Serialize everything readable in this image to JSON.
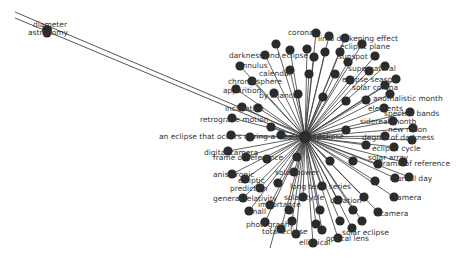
{
  "graph": {
    "type": "network",
    "layout": "radial-star",
    "colors": {
      "node": "#2b2b2b",
      "edge": "#3a3a3a",
      "label": "#333333",
      "background": "#ffffff"
    },
    "hub": {
      "x": 305,
      "y": 137,
      "label": "solar eclipse"
    },
    "outlier": {
      "x": 47,
      "y": 30,
      "labels": [
        "diameter",
        "astronomy"
      ]
    },
    "long_edges": [
      {
        "x1": 15,
        "y1": 12,
        "x2": 305,
        "y2": 135
      },
      {
        "x1": 15,
        "y1": 18,
        "x2": 305,
        "y2": 139
      }
    ],
    "nodes": [
      {
        "x": 316,
        "y": 33,
        "label": "corona"
      },
      {
        "x": 329,
        "y": 36,
        "label": "shadow"
      },
      {
        "x": 345,
        "y": 38,
        "label": "limb darkening effect"
      },
      {
        "x": 362,
        "y": 44,
        "label": "ecliptic plane"
      },
      {
        "x": 276,
        "y": 44,
        "label": "sun"
      },
      {
        "x": 290,
        "y": 50,
        "label": ""
      },
      {
        "x": 307,
        "y": 49,
        "label": "penumbra"
      },
      {
        "x": 325,
        "y": 52,
        "label": ""
      },
      {
        "x": 340,
        "y": 52,
        "label": ""
      },
      {
        "x": 375,
        "y": 56,
        "label": "sunspot"
      },
      {
        "x": 265,
        "y": 55,
        "label": "darkness and eclipse"
      },
      {
        "x": 314,
        "y": 57,
        "label": ""
      },
      {
        "x": 348,
        "y": 62,
        "label": ""
      },
      {
        "x": 240,
        "y": 66,
        "label": "annulus"
      },
      {
        "x": 385,
        "y": 66,
        "label": "supernatural"
      },
      {
        "x": 290,
        "y": 70,
        "label": "calendar"
      },
      {
        "x": 309,
        "y": 74,
        "label": ""
      },
      {
        "x": 335,
        "y": 74,
        "label": ""
      },
      {
        "x": 369,
        "y": 71,
        "label": ""
      },
      {
        "x": 396,
        "y": 79,
        "label": "eclipse season"
      },
      {
        "x": 252,
        "y": 81,
        "label": "chromosphere"
      },
      {
        "x": 236,
        "y": 89,
        "label": "apparition"
      },
      {
        "x": 350,
        "y": 80,
        "label": ""
      },
      {
        "x": 385,
        "y": 85,
        "label": "solar corona"
      },
      {
        "x": 274,
        "y": 93,
        "label": "by chance"
      },
      {
        "x": 298,
        "y": 94,
        "label": ""
      },
      {
        "x": 323,
        "y": 97,
        "label": ""
      },
      {
        "x": 346,
        "y": 101,
        "label": ""
      },
      {
        "x": 366,
        "y": 100,
        "label": ""
      },
      {
        "x": 390,
        "y": 94,
        "label": "anomalistic month"
      },
      {
        "x": 242,
        "y": 107,
        "label": "inclination"
      },
      {
        "x": 258,
        "y": 108,
        "label": ""
      },
      {
        "x": 384,
        "y": 108,
        "label": "elements"
      },
      {
        "x": 410,
        "y": 112,
        "label": "spectral bands"
      },
      {
        "x": 232,
        "y": 118,
        "label": "retrograde motion"
      },
      {
        "x": 393,
        "y": 121,
        "label": "sidereal month"
      },
      {
        "x": 271,
        "y": 127,
        "label": "phase"
      },
      {
        "x": 346,
        "y": 130,
        "label": "umbra"
      },
      {
        "x": 413,
        "y": 128,
        "label": "new moon"
      },
      {
        "x": 231,
        "y": 135,
        "label": "an eclipse that occurs during a total solar eclipse"
      },
      {
        "x": 250,
        "y": 137,
        "label": ""
      },
      {
        "x": 281,
        "y": 135,
        "label": ""
      },
      {
        "x": 385,
        "y": 136,
        "label": "degree of darkness"
      },
      {
        "x": 412,
        "y": 140,
        "label": "brightness"
      },
      {
        "x": 366,
        "y": 145,
        "label": "tides"
      },
      {
        "x": 394,
        "y": 147,
        "label": "ecliptic cycle"
      },
      {
        "x": 228,
        "y": 151,
        "label": "digital camera"
      },
      {
        "x": 246,
        "y": 157,
        "label": "frame of reference"
      },
      {
        "x": 267,
        "y": 159,
        "label": ""
      },
      {
        "x": 297,
        "y": 157,
        "label": ""
      },
      {
        "x": 330,
        "y": 161,
        "label": ""
      },
      {
        "x": 353,
        "y": 161,
        "label": "solar array"
      },
      {
        "x": 378,
        "y": 164,
        "label": ""
      },
      {
        "x": 403,
        "y": 162,
        "label": "frame of reference"
      },
      {
        "x": 294,
        "y": 172,
        "label": "solar power"
      },
      {
        "x": 232,
        "y": 174,
        "label": "anisotropic"
      },
      {
        "x": 245,
        "y": 179,
        "label": "ecliptic"
      },
      {
        "x": 278,
        "y": 183,
        "label": ""
      },
      {
        "x": 375,
        "y": 181,
        "label": ""
      },
      {
        "x": 395,
        "y": 178,
        "label": "solar day"
      },
      {
        "x": 409,
        "y": 177,
        "label": "diurnal day"
      },
      {
        "x": 260,
        "y": 188,
        "label": "prediction"
      },
      {
        "x": 322,
        "y": 186,
        "label": "long term series"
      },
      {
        "x": 243,
        "y": 198,
        "label": "general relativity"
      },
      {
        "x": 303,
        "y": 197,
        "label": "solar cycle"
      },
      {
        "x": 338,
        "y": 200,
        "label": "duration"
      },
      {
        "x": 364,
        "y": 197,
        "label": ""
      },
      {
        "x": 394,
        "y": 197,
        "label": "camera"
      },
      {
        "x": 270,
        "y": 205,
        "label": "importance"
      },
      {
        "x": 289,
        "y": 210,
        "label": ""
      },
      {
        "x": 320,
        "y": 210,
        "label": ""
      },
      {
        "x": 353,
        "y": 210,
        "label": ""
      },
      {
        "x": 378,
        "y": 212,
        "label": "camera"
      },
      {
        "x": 249,
        "y": 211,
        "label": "small"
      },
      {
        "x": 265,
        "y": 222,
        "label": "photography"
      },
      {
        "x": 292,
        "y": 221,
        "label": ""
      },
      {
        "x": 316,
        "y": 224,
        "label": ""
      },
      {
        "x": 340,
        "y": 221,
        "label": ""
      },
      {
        "x": 362,
        "y": 221,
        "label": ""
      },
      {
        "x": 281,
        "y": 229,
        "label": "total eclipse"
      },
      {
        "x": 296,
        "y": 234,
        "label": ""
      },
      {
        "x": 322,
        "y": 230,
        "label": ""
      },
      {
        "x": 352,
        "y": 228,
        "label": "solar eclipse"
      },
      {
        "x": 313,
        "y": 243,
        "label": "elliptical"
      },
      {
        "x": 338,
        "y": 238,
        "label": "optical lens"
      }
    ],
    "tail_edge": {
      "x1": 270,
      "y1": 248,
      "x2": 276,
      "y2": 226
    },
    "visible_labels_positions": [
      {
        "text": "diameter",
        "x": 33,
        "y": 27
      },
      {
        "text": "astronomy",
        "x": 28,
        "y": 35
      },
      {
        "text": "corona",
        "x": 288,
        "y": 35
      },
      {
        "text": "limb darkening effect",
        "x": 318,
        "y": 41
      },
      {
        "text": "ecliptic plane",
        "x": 340,
        "y": 49
      },
      {
        "text": "darkness and eclipse",
        "x": 229,
        "y": 58
      },
      {
        "text": "sunspot",
        "x": 338,
        "y": 59
      },
      {
        "text": "annulus",
        "x": 238,
        "y": 68
      },
      {
        "text": "supernatural",
        "x": 348,
        "y": 71
      },
      {
        "text": "calendar",
        "x": 259,
        "y": 76
      },
      {
        "text": "chromosphere",
        "x": 228,
        "y": 84
      },
      {
        "text": "eclipse season",
        "x": 342,
        "y": 82
      },
      {
        "text": "apparition",
        "x": 223,
        "y": 93
      },
      {
        "text": "solar corona",
        "x": 352,
        "y": 90
      },
      {
        "text": "by chance",
        "x": 259,
        "y": 98
      },
      {
        "text": "anomalistic month",
        "x": 373,
        "y": 101
      },
      {
        "text": "inclination",
        "x": 225,
        "y": 111
      },
      {
        "text": "elements",
        "x": 368,
        "y": 111
      },
      {
        "text": "spectral bands",
        "x": 384,
        "y": 116
      },
      {
        "text": "retrograde motion",
        "x": 200,
        "y": 122
      },
      {
        "text": "sidereal month",
        "x": 360,
        "y": 124
      },
      {
        "text": "new moon",
        "x": 388,
        "y": 132
      },
      {
        "text": "an eclipse that occurs during a total solar eclipse",
        "x": 159,
        "y": 139
      },
      {
        "text": "degree of darkness",
        "x": 362,
        "y": 140
      },
      {
        "text": "ecliptic cycle",
        "x": 372,
        "y": 151
      },
      {
        "text": "digital camera",
        "x": 204,
        "y": 155
      },
      {
        "text": "frame of reference",
        "x": 213,
        "y": 160
      },
      {
        "text": "solar array",
        "x": 368,
        "y": 160
      },
      {
        "text": "frame of reference",
        "x": 380,
        "y": 166
      },
      {
        "text": "solar power",
        "x": 275,
        "y": 175
      },
      {
        "text": "anisotropic",
        "x": 213,
        "y": 177
      },
      {
        "text": "ecliptic",
        "x": 238,
        "y": 183
      },
      {
        "text": "diurnal day",
        "x": 390,
        "y": 181
      },
      {
        "text": "prediction",
        "x": 230,
        "y": 191
      },
      {
        "text": "long term series",
        "x": 290,
        "y": 189
      },
      {
        "text": "general relativity",
        "x": 213,
        "y": 201
      },
      {
        "text": "solar cycle",
        "x": 284,
        "y": 200
      },
      {
        "text": "duration",
        "x": 330,
        "y": 203
      },
      {
        "text": "camera",
        "x": 393,
        "y": 200
      },
      {
        "text": "importance",
        "x": 258,
        "y": 207
      },
      {
        "text": "small",
        "x": 246,
        "y": 214
      },
      {
        "text": "camera",
        "x": 380,
        "y": 216
      },
      {
        "text": "photography",
        "x": 246,
        "y": 227
      },
      {
        "text": "solar eclipse",
        "x": 342,
        "y": 235
      },
      {
        "text": "total eclipse",
        "x": 262,
        "y": 234
      },
      {
        "text": "elliptical",
        "x": 299,
        "y": 245
      },
      {
        "text": "optical lens",
        "x": 326,
        "y": 241
      }
    ]
  }
}
